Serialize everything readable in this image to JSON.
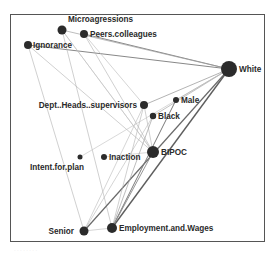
{
  "diagram": {
    "type": "network-graph",
    "nodes": [
      {
        "id": "Microagressions",
        "label": "Microagressions",
        "x": 62,
        "y": 30,
        "r": 4.5,
        "label_pos": "above",
        "lx": 68,
        "ly": 22
      },
      {
        "id": "Peers.colleagues",
        "label": "Peers.colleagues",
        "x": 84,
        "y": 34,
        "r": 4,
        "label_pos": "right",
        "lx": 90,
        "ly": 37
      },
      {
        "id": "Ignorance",
        "label": "Ignorance",
        "x": 28,
        "y": 45,
        "r": 4,
        "label_pos": "right",
        "lx": 33,
        "ly": 48
      },
      {
        "id": "White",
        "label": "White",
        "x": 229,
        "y": 69,
        "r": 8,
        "label_pos": "right",
        "lx": 239,
        "ly": 72
      },
      {
        "id": "Dept..Heads..supervisors",
        "label": "Dept..Heads..supervisors",
        "x": 144,
        "y": 105,
        "r": 4,
        "label_pos": "left",
        "lx": 137,
        "ly": 108,
        "anchor": "end"
      },
      {
        "id": "Male",
        "label": "Male",
        "x": 176,
        "y": 100,
        "r": 3,
        "label_pos": "right",
        "lx": 181,
        "ly": 103
      },
      {
        "id": "Black",
        "label": "Black",
        "x": 153,
        "y": 116,
        "r": 3.2,
        "label_pos": "right",
        "lx": 158,
        "ly": 119
      },
      {
        "id": "BIPOC",
        "label": "BIPOC",
        "x": 153,
        "y": 152,
        "r": 6,
        "label_pos": "right",
        "lx": 161,
        "ly": 155
      },
      {
        "id": "Intent.for.plan",
        "label": "Intent.for.plan",
        "x": 80,
        "y": 157,
        "r": 2.5,
        "label_pos": "below-left",
        "lx": 30,
        "ly": 170
      },
      {
        "id": "Inaction",
        "label": "Inaction",
        "x": 104,
        "y": 157,
        "r": 3,
        "label_pos": "right",
        "lx": 109,
        "ly": 160
      },
      {
        "id": "Senior",
        "label": "Senior",
        "x": 84,
        "y": 231,
        "r": 4.5,
        "label_pos": "left",
        "lx": 74,
        "ly": 234,
        "anchor": "end"
      },
      {
        "id": "Employment.and.Wages",
        "label": "Employment.and.Wages",
        "x": 112,
        "y": 228,
        "r": 5,
        "label_pos": "right",
        "lx": 119,
        "ly": 231
      }
    ],
    "edges": [
      {
        "from": "Peers.colleagues",
        "to": "White",
        "w": 1.0,
        "c": "#888888"
      },
      {
        "from": "Microagressions",
        "to": "White",
        "w": 0.7,
        "c": "#a0a0a0"
      },
      {
        "from": "Ignorance",
        "to": "White",
        "w": 1.0,
        "c": "#888888"
      },
      {
        "from": "Ignorance",
        "to": "Senior",
        "w": 0.6,
        "c": "#b0b0b0"
      },
      {
        "from": "Ignorance",
        "to": "BIPOC",
        "w": 0.6,
        "c": "#b0b0b0"
      },
      {
        "from": "Microagressions",
        "to": "Employment.and.Wages",
        "w": 0.6,
        "c": "#b0b0b0"
      },
      {
        "from": "Microagressions",
        "to": "BIPOC",
        "w": 0.6,
        "c": "#b0b0b0"
      },
      {
        "from": "Peers.colleagues",
        "to": "BIPOC",
        "w": 0.6,
        "c": "#b0b0b0"
      },
      {
        "from": "Peers.colleagues",
        "to": "Dept..Heads..supervisors",
        "w": 0.6,
        "c": "#b8b8b8"
      },
      {
        "from": "Dept..Heads..supervisors",
        "to": "White",
        "w": 0.8,
        "c": "#a0a0a0"
      },
      {
        "from": "Dept..Heads..supervisors",
        "to": "BIPOC",
        "w": 0.6,
        "c": "#b0b0b0"
      },
      {
        "from": "Dept..Heads..supervisors",
        "to": "Senior",
        "w": 0.6,
        "c": "#b8b8b8"
      },
      {
        "from": "Male",
        "to": "White",
        "w": 0.7,
        "c": "#a8a8a8"
      },
      {
        "from": "Black",
        "to": "White",
        "w": 0.7,
        "c": "#a8a8a8"
      },
      {
        "from": "Intent.for.plan",
        "to": "White",
        "w": 0.6,
        "c": "#c0c0c0"
      },
      {
        "from": "Inaction",
        "to": "BIPOC",
        "w": 0.6,
        "c": "#c0c0c0"
      },
      {
        "from": "Senior",
        "to": "White",
        "w": 1.2,
        "c": "#6a6a6a"
      },
      {
        "from": "Senior",
        "to": "Employment.and.Wages",
        "w": 0.6,
        "c": "#b8b8b8"
      },
      {
        "from": "Senior",
        "to": "Black",
        "w": 0.6,
        "c": "#b8b8b8"
      },
      {
        "from": "Employment.and.Wages",
        "to": "White",
        "w": 1.4,
        "c": "#5e5e5e"
      },
      {
        "from": "Employment.and.Wages",
        "to": "Male",
        "w": 1.0,
        "c": "#7a7a7a"
      },
      {
        "from": "Employment.and.Wages",
        "to": "BIPOC",
        "w": 0.9,
        "c": "#8a8a8a"
      },
      {
        "from": "Employment.and.Wages",
        "to": "Black",
        "w": 0.7,
        "c": "#a0a0a0"
      },
      {
        "from": "Employment.and.Wages",
        "to": "Dept..Heads..supervisors",
        "w": 0.6,
        "c": "#b0b0b0"
      },
      {
        "from": "BIPOC",
        "to": "Microagressions",
        "w": 0.5,
        "c": "#c4c4c4"
      }
    ],
    "node_color": "#2b2b2b",
    "caption": "· · · · · · · ·"
  }
}
